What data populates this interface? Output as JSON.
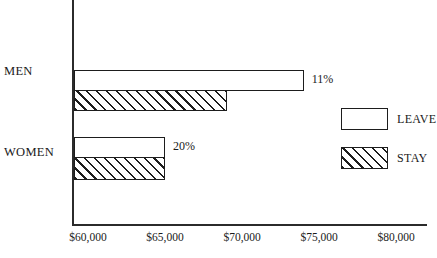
{
  "chart_data": {
    "type": "bar",
    "orientation": "horizontal",
    "title": "",
    "xlabel": "",
    "ylabel": "",
    "grid": false,
    "legend_position": "right",
    "categories": [
      "MEN",
      "WOMEN"
    ],
    "xlim": [
      59030,
      82000
    ],
    "xticks": [
      60000,
      65000,
      70000,
      75000,
      80000
    ],
    "xtick_labels": [
      "$60,000",
      "$65,000",
      "$70,000",
      "$75,000",
      "$80,000"
    ],
    "series": [
      {
        "name": "LEAVE",
        "fill": "white",
        "values": [
          74000,
          65000
        ],
        "value_labels": [
          "",
          ""
        ]
      },
      {
        "name": "STAY",
        "fill": "hatched",
        "values": [
          69000,
          65000
        ],
        "value_labels": [
          "",
          ""
        ]
      }
    ],
    "annotations": [
      {
        "text": "11%",
        "category": "MEN"
      },
      {
        "text": "20%",
        "category": "WOMEN"
      }
    ]
  },
  "axis": {
    "ticks": [
      {
        "label": "$60,000",
        "value": 60000
      },
      {
        "label": "$65,000",
        "value": 65000
      },
      {
        "label": "$70,000",
        "value": 70000
      },
      {
        "label": "$75,000",
        "value": 75000
      },
      {
        "label": "$80,000",
        "value": 80000
      }
    ]
  },
  "categories": {
    "men": "MEN",
    "women": "WOMEN"
  },
  "annotations": {
    "men_pct": "11%",
    "women_pct": "20%"
  },
  "legend": {
    "leave": "LEAVE",
    "stay": "STAY"
  },
  "colors": {
    "ink": "#1d1d1d",
    "background": "#ffffff"
  }
}
